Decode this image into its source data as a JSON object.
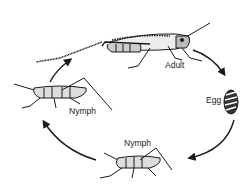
{
  "diagram": {
    "type": "life-cycle",
    "stages": [
      {
        "id": "adult",
        "label": "Adult"
      },
      {
        "id": "egg",
        "label": "Egg"
      },
      {
        "id": "nymph_late",
        "label": "Nymph"
      },
      {
        "id": "nymph_early",
        "label": "Nymph"
      }
    ],
    "arrows": [
      {
        "from": "adult",
        "to": "egg"
      },
      {
        "from": "egg",
        "to": "nymph_late"
      },
      {
        "from": "nymph_late",
        "to": "nymph_early"
      },
      {
        "from": "nymph_early",
        "to": "adult"
      }
    ],
    "colors": {
      "ink": "#1a1a1a",
      "background": "#ffffff",
      "label": "#222222"
    }
  }
}
